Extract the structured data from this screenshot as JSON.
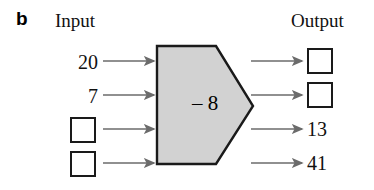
{
  "figure": {
    "part_label": "b",
    "headings": {
      "input": "Input",
      "output": "Output"
    },
    "machine": {
      "operation_label": "– 8",
      "operation": "subtract",
      "operand": 8,
      "shape": "pentagon-arrow",
      "fill_color": "#d2d2d2",
      "stroke_color": "#1a1a1a"
    },
    "rows": [
      {
        "input_value": "20",
        "input_type": "value",
        "output_value": "",
        "output_type": "blank-box"
      },
      {
        "input_value": "7",
        "input_type": "value",
        "output_value": "",
        "output_type": "blank-box"
      },
      {
        "input_value": "",
        "input_type": "blank-box",
        "output_value": "13",
        "output_type": "value"
      },
      {
        "input_value": "",
        "input_type": "blank-box",
        "output_value": "41",
        "output_type": "value"
      }
    ],
    "arrow_color": "#6b6b6b",
    "box_border_color": "#1a1a1a",
    "background_color": "#ffffff"
  }
}
